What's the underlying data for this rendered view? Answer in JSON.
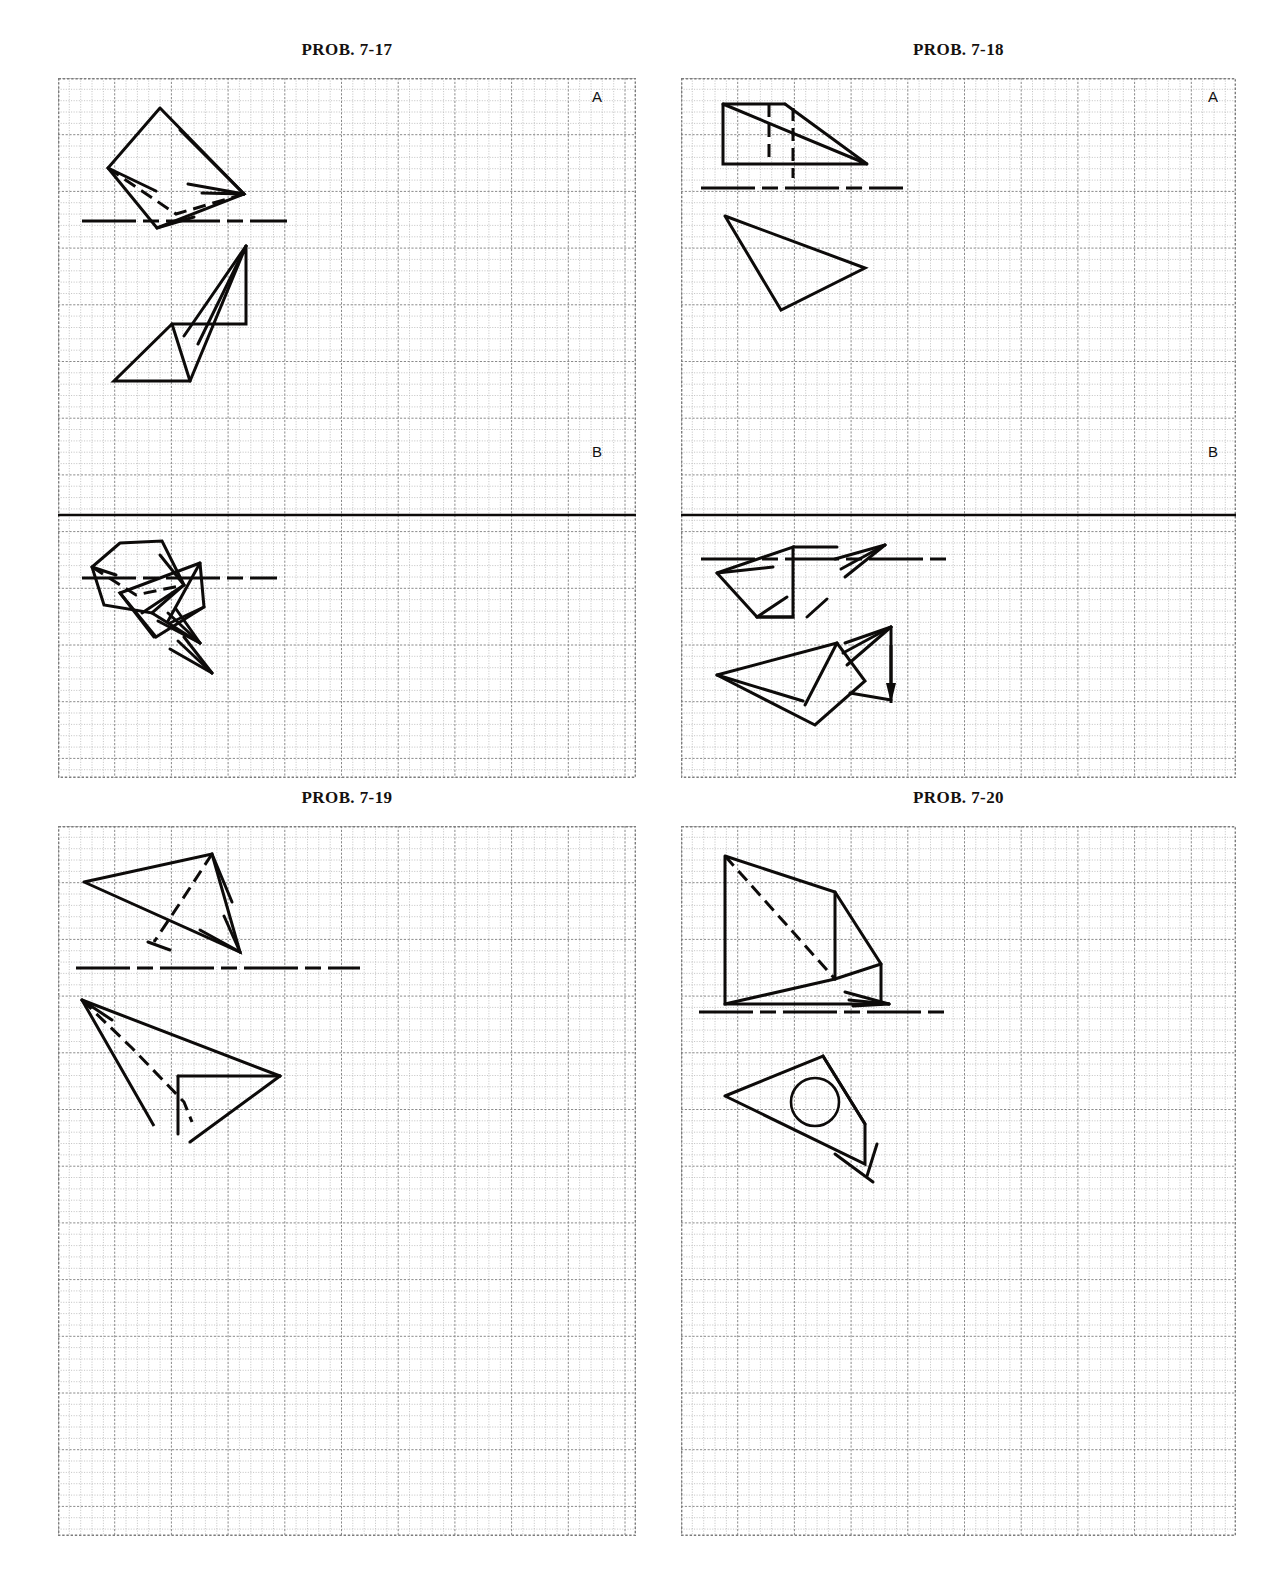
{
  "page": {
    "kind": "engineering-graphics-worksheet",
    "width": 1276,
    "height": 1569,
    "background": "#ffffff",
    "ink": "#0d0b0a",
    "grid_minor_color": "#b9b9b9",
    "grid_major_color": "#8a8a8a",
    "grid_border_color": "#7d7d7d"
  },
  "panels": [
    {
      "id": "prob-7-17",
      "title": "PROB. 7-17",
      "zones": [
        "A",
        "B"
      ],
      "has_zone_divider": true,
      "frame": {
        "x": 58,
        "y": 78,
        "w": 578,
        "h": 700
      },
      "grid": {
        "minor": 11.34,
        "major_every": 5
      },
      "title_pos": {
        "x": 58,
        "y": 40,
        "w": 578
      }
    },
    {
      "id": "prob-7-18",
      "title": "PROB. 7-18",
      "zones": [
        "A",
        "B"
      ],
      "has_zone_divider": true,
      "frame": {
        "x": 681,
        "y": 78,
        "w": 555,
        "h": 700
      },
      "grid": {
        "minor": 11.34,
        "major_every": 5
      },
      "title_pos": {
        "x": 681,
        "y": 40,
        "w": 555
      }
    },
    {
      "id": "prob-7-19",
      "title": "PROB. 7-19",
      "zones": [],
      "has_zone_divider": false,
      "frame": {
        "x": 58,
        "y": 826,
        "w": 578,
        "h": 710
      },
      "grid": {
        "minor": 11.34,
        "major_every": 5
      },
      "title_pos": {
        "x": 58,
        "y": 788,
        "w": 578
      }
    },
    {
      "id": "prob-7-20",
      "title": "PROB. 7-20",
      "zones": [],
      "has_zone_divider": false,
      "frame": {
        "x": 681,
        "y": 826,
        "w": 555,
        "h": 710
      },
      "grid": {
        "minor": 11.34,
        "major_every": 5
      },
      "title_pos": {
        "x": 681,
        "y": 788,
        "w": 555
      }
    }
  ],
  "zone_labels": [
    {
      "panel": "prob-7-17",
      "text": "A",
      "x": 592,
      "y": 88
    },
    {
      "panel": "prob-7-17",
      "text": "B",
      "x": 592,
      "y": 443
    },
    {
      "panel": "prob-7-18",
      "text": "A",
      "x": 1208,
      "y": 88
    },
    {
      "panel": "prob-7-18",
      "text": "B",
      "x": 1208,
      "y": 443
    }
  ],
  "drawings": {
    "prob-7-17": {
      "zone_divider": {
        "y": 437,
        "x1": 0,
        "x2": 578,
        "width": 2.6
      },
      "fold_lines": [
        {
          "y": 143,
          "x1": 10,
          "x2": 215,
          "label": "fold-line-a"
        },
        {
          "y": 500,
          "x1": 10,
          "x2": 205,
          "label": "fold-line-b"
        }
      ],
      "solid_polylines": [
        [
          [
            88,
            22
          ],
          [
            36,
            82
          ],
          [
            85,
            142
          ],
          [
            172,
            108
          ],
          [
            88,
            22
          ]
        ],
        [
          [
            36,
            82
          ],
          [
            84,
            105
          ]
        ],
        [
          [
            85,
            142
          ],
          [
            122,
            131
          ]
        ],
        [
          [
            172,
            108
          ],
          [
            108,
            44
          ]
        ],
        [
          [
            172,
            108
          ],
          [
            116,
            98
          ]
        ],
        [
          [
            172,
            108
          ],
          [
            130,
            107
          ]
        ],
        [
          [
            174,
            160
          ],
          [
            118,
            295
          ],
          [
            42,
            295
          ],
          [
            100,
            238
          ],
          [
            174,
            238
          ],
          [
            174,
            160
          ]
        ],
        [
          [
            100,
            238
          ],
          [
            118,
            295
          ]
        ],
        [
          [
            174,
            160
          ],
          [
            112,
            250
          ]
        ],
        [
          [
            174,
            160
          ],
          [
            126,
            258
          ]
        ],
        [
          [
            48,
            18
          ],
          [
            20,
            42
          ],
          [
            32,
            80
          ],
          [
            80,
            88
          ],
          [
            112,
            60
          ],
          [
            90,
            16
          ],
          [
            48,
            18
          ]
        ],
        [
          [
            112,
            60
          ],
          [
            70,
            88
          ]
        ],
        [
          [
            112,
            60
          ],
          [
            88,
            30
          ]
        ],
        [
          [
            80,
            88
          ],
          [
            128,
            118
          ]
        ],
        [
          [
            20,
            42
          ],
          [
            44,
            50
          ]
        ],
        [
          [
            128,
            118
          ],
          [
            86,
            96
          ]
        ],
        [
          [
            128,
            118
          ],
          [
            96,
            88
          ]
        ],
        [
          [
            128,
            118
          ],
          [
            104,
            84
          ]
        ],
        [
          [
            128,
            38
          ],
          [
            48,
            68
          ],
          [
            84,
            112
          ],
          [
            132,
            82
          ],
          [
            128,
            38
          ]
        ],
        [
          [
            48,
            68
          ],
          [
            82,
            112
          ]
        ],
        [
          [
            128,
            38
          ],
          [
            96,
            96
          ]
        ],
        [
          [
            132,
            82
          ],
          [
            98,
            98
          ]
        ],
        [
          [
            140,
            148
          ],
          [
            98,
            124
          ]
        ],
        [
          [
            140,
            148
          ],
          [
            106,
            116
          ]
        ],
        [
          [
            140,
            148
          ],
          [
            112,
            112
          ]
        ]
      ],
      "dashed_polylines": [
        [
          [
            36,
            82
          ],
          [
            104,
            128
          ],
          [
            172,
            108
          ]
        ],
        [
          [
            20,
            42
          ],
          [
            64,
            70
          ],
          [
            112,
            60
          ]
        ]
      ]
    },
    "prob-7-18": {
      "zone_divider": {
        "y": 437,
        "x1": 0,
        "x2": 555,
        "width": 2.6
      },
      "fold_lines": [
        {
          "y": 110,
          "x1": 6,
          "x2": 208,
          "label": "fold-line-a"
        },
        {
          "y": 481,
          "x1": 6,
          "x2": 252,
          "label": "fold-line-b"
        }
      ],
      "solid_polylines": [
        [
          [
            28,
            18
          ],
          [
            28,
            78
          ],
          [
            172,
            78
          ],
          [
            28,
            18
          ]
        ],
        [
          [
            28,
            18
          ],
          [
            90,
            18
          ]
        ],
        [
          [
            90,
            18
          ],
          [
            172,
            78
          ]
        ],
        [
          [
            30,
            130
          ],
          [
            86,
            224
          ],
          [
            170,
            182
          ],
          [
            30,
            130
          ]
        ],
        [
          [
            22,
            48
          ],
          [
            98,
            22
          ],
          [
            98,
            92
          ],
          [
            62,
            92
          ],
          [
            22,
            48
          ]
        ],
        [
          [
            22,
            48
          ],
          [
            78,
            42
          ]
        ],
        [
          [
            98,
            22
          ],
          [
            142,
            22
          ]
        ],
        [
          [
            62,
            92
          ],
          [
            92,
            72
          ]
        ],
        [
          [
            112,
            92
          ],
          [
            132,
            74
          ]
        ],
        [
          [
            62,
            92
          ],
          [
            98,
            92
          ]
        ],
        [
          [
            190,
            20
          ],
          [
            140,
            34
          ]
        ],
        [
          [
            190,
            20
          ],
          [
            146,
            44
          ]
        ],
        [
          [
            190,
            20
          ],
          [
            150,
            52
          ]
        ],
        [
          [
            22,
            150
          ],
          [
            142,
            118
          ],
          [
            170,
            156
          ],
          [
            120,
            200
          ],
          [
            22,
            150
          ]
        ],
        [
          [
            22,
            150
          ],
          [
            108,
            176
          ]
        ],
        [
          [
            142,
            118
          ],
          [
            110,
            180
          ]
        ],
        [
          [
            196,
            102
          ],
          [
            150,
            118
          ]
        ],
        [
          [
            196,
            102
          ],
          [
            148,
            128
          ]
        ],
        [
          [
            196,
            102
          ],
          [
            152,
            140
          ]
        ],
        [
          [
            196,
            102
          ],
          [
            196,
            170
          ]
        ],
        [
          [
            196,
            175
          ],
          [
            155,
            168
          ]
        ]
      ],
      "dashed_polylines": [
        [
          [
            74,
            18
          ],
          [
            74,
            78
          ]
        ],
        [
          [
            98,
            22
          ],
          [
            98,
            92
          ]
        ]
      ],
      "solid_arrow_down": {
        "x": 196,
        "y1": 120,
        "y2": 178
      }
    },
    "prob-7-19": {
      "fold_lines": [
        {
          "y": 142,
          "x1": 4,
          "x2": 288,
          "label": "fold-line"
        }
      ],
      "solid_polylines": [
        [
          [
            12,
            48
          ],
          [
            140,
            20
          ],
          [
            168,
            118
          ],
          [
            12,
            48
          ]
        ],
        [
          [
            140,
            20
          ],
          [
            160,
            68
          ]
        ],
        [
          [
            168,
            118
          ],
          [
            128,
            96
          ]
        ],
        [
          [
            168,
            118
          ],
          [
            152,
            82
          ]
        ],
        [
          [
            76,
            108
          ],
          [
            98,
            116
          ]
        ],
        [
          [
            10,
            166
          ],
          [
            82,
            292
          ],
          [
            10,
            166
          ]
        ],
        [
          [
            10,
            166
          ],
          [
            208,
            242
          ]
        ],
        [
          [
            208,
            242
          ],
          [
            106,
            242
          ]
        ],
        [
          [
            106,
            242
          ],
          [
            106,
            300
          ]
        ],
        [
          [
            208,
            242
          ],
          [
            118,
            308
          ]
        ],
        [
          [
            10,
            166
          ],
          [
            40,
            186
          ]
        ]
      ],
      "dashed_polylines": [
        [
          [
            140,
            20
          ],
          [
            110,
            66
          ],
          [
            82,
            108
          ]
        ],
        [
          [
            10,
            166
          ],
          [
            60,
            214
          ],
          [
            112,
            268
          ],
          [
            120,
            288
          ]
        ]
      ]
    },
    "prob-7-20": {
      "fold_lines": [
        {
          "y": 186,
          "x1": 4,
          "x2": 252,
          "label": "fold-line"
        }
      ],
      "solid_polylines": [
        [
          [
            30,
            22
          ],
          [
            30,
            170
          ],
          [
            186,
            170
          ],
          [
            186,
            130
          ],
          [
            140,
            58
          ],
          [
            30,
            22
          ]
        ],
        [
          [
            140,
            58
          ],
          [
            140,
            145
          ]
        ],
        [
          [
            30,
            170
          ],
          [
            140,
            145
          ]
        ],
        [
          [
            140,
            145
          ],
          [
            186,
            130
          ]
        ],
        [
          [
            194,
            170
          ],
          [
            150,
            158
          ]
        ],
        [
          [
            194,
            170
          ],
          [
            154,
            166
          ]
        ],
        [
          [
            194,
            170
          ],
          [
            158,
            172
          ]
        ],
        [
          [
            30,
            262
          ],
          [
            128,
            222
          ],
          [
            170,
            290
          ],
          [
            170,
            330
          ],
          [
            30,
            262
          ]
        ],
        [
          [
            128,
            222
          ],
          [
            170,
            290
          ]
        ],
        [
          [
            182,
            310
          ],
          [
            172,
            342
          ]
        ],
        [
          [
            178,
            348
          ],
          [
            140,
            320
          ]
        ]
      ],
      "dashed_polylines": [
        [
          [
            30,
            22
          ],
          [
            140,
            145
          ]
        ]
      ],
      "circles": [
        {
          "cx": 120,
          "cy": 268,
          "r": 24
        }
      ]
    }
  }
}
